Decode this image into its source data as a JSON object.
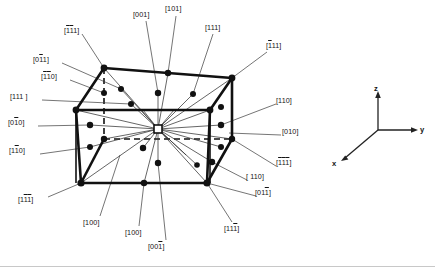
{
  "figure": {
    "background_color": "#ffffff",
    "line_color": "#111111",
    "node_color": "#111111",
    "origin_marker": "open-square"
  },
  "axes": {
    "x_label": "x",
    "y_label": "y",
    "z_label": "z"
  },
  "labels": {
    "top_1": {
      "pre": "[",
      "bar1": "1",
      "bar2": "1",
      "plain": "1",
      "post": "]",
      "text": "[1̄1̄1]"
    },
    "top_001": "[001]",
    "top_101": "[101]",
    "top_111": "[111]",
    "right_bar111": "[̄1 1 1]",
    "left_0bar11": "[0̄1 1]",
    "left_bar1bar10": "[̄1̄1 0]",
    "left_111": "[111 ]",
    "left_0bar10": "[0̄1 0]",
    "left_bar1bar10b": "[1̄1 0]",
    "left_bottom": "[1̄1̄1]",
    "bottom_100_a": "[100]",
    "bottom_100_b": "[100]",
    "bottom_00bar1": "[00̄1]",
    "bottom_11bar1": "[11̄1]",
    "right_110_upper": "[110]",
    "right_010": "[010]",
    "right_bar1bar1bar1": "[̄1̄1̄1]",
    "right_110_lower": "[ 110]",
    "right_01bar1": "[01̄1]"
  },
  "label_list": [
    {
      "id": "l-top-1bar1bar11",
      "text": "[111]",
      "bars": [
        1,
        1,
        0
      ],
      "x": 64,
      "y": 30
    },
    {
      "id": "l-001",
      "text": "[001]",
      "bars": [
        0,
        0,
        0
      ],
      "x": 136,
      "y": 14
    },
    {
      "id": "l-101",
      "text": "[101]",
      "bars": [
        0,
        0,
        0
      ],
      "x": 167,
      "y": 7
    },
    {
      "id": "l-111",
      "text": "[111]",
      "bars": [
        0,
        0,
        0
      ],
      "x": 207,
      "y": 27
    },
    {
      "id": "l-bar111",
      "text": "[111]",
      "bars": [
        1,
        0,
        0
      ],
      "x": 268,
      "y": 45
    },
    {
      "id": "l-0bar11",
      "text": "[011]",
      "bars": [
        0,
        1,
        0
      ],
      "x": 35,
      "y": 59
    },
    {
      "id": "l-bar1bar10",
      "text": "[110]",
      "bars": [
        1,
        1,
        0
      ],
      "x": 43,
      "y": 76
    },
    {
      "id": "l-111b",
      "text": "[111 ]",
      "bars": [
        0,
        0,
        0
      ],
      "x": 12,
      "y": 96
    },
    {
      "id": "l-0bar10",
      "text": "[010]",
      "bars": [
        0,
        1,
        0
      ],
      "x": 10,
      "y": 122
    },
    {
      "id": "l-1bar10",
      "text": "[110]",
      "bars": [
        0,
        1,
        0
      ],
      "x": 11,
      "y": 150
    },
    {
      "id": "l-1bar1bar1",
      "text": "[111]",
      "bars": [
        0,
        1,
        1
      ],
      "x": 20,
      "y": 199
    },
    {
      "id": "l-100a",
      "text": "[100]",
      "bars": [
        0,
        0,
        0
      ],
      "x": 85,
      "y": 222
    },
    {
      "id": "l-100b",
      "text": "[100]",
      "bars": [
        0,
        0,
        0
      ],
      "x": 127,
      "y": 232
    },
    {
      "id": "l-00bar1",
      "text": "[001]",
      "bars": [
        0,
        0,
        1
      ],
      "x": 150,
      "y": 246
    },
    {
      "id": "l-11bar1",
      "text": "[111]",
      "bars": [
        0,
        0,
        1
      ],
      "x": 226,
      "y": 228
    },
    {
      "id": "l-110up",
      "text": "[110]",
      "bars": [
        0,
        0,
        0
      ],
      "x": 277,
      "y": 100
    },
    {
      "id": "l-010",
      "text": "[010]",
      "bars": [
        0,
        0,
        0
      ],
      "x": 283,
      "y": 131
    },
    {
      "id": "l-bar1bar1bar1",
      "text": "[111]",
      "bars": [
        1,
        1,
        1
      ],
      "x": 277,
      "y": 162
    },
    {
      "id": "l-110low",
      "text": "[110]",
      "bars": [
        0,
        0,
        0
      ],
      "x": 248,
      "y": 176
    },
    {
      "id": "l-01bar1",
      "text": "[011]",
      "bars": [
        0,
        0,
        1
      ],
      "x": 257,
      "y": 192
    }
  ]
}
